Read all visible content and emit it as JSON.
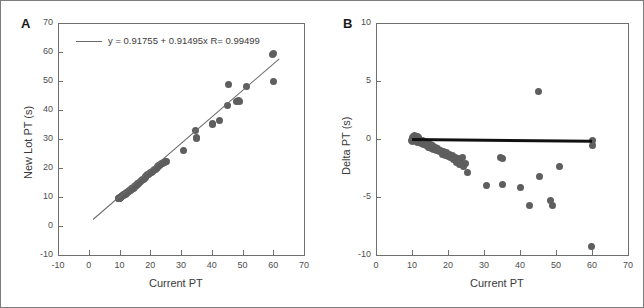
{
  "figure": {
    "background": "#ffffff",
    "border_color": "#7d7d7d",
    "marker_color": "#5e5e5e",
    "fitline_color": "#6b6b6b",
    "zeroline_color": "#111111"
  },
  "chart_data": [
    {
      "type": "scatter",
      "panel": "A",
      "panel_label": "A",
      "title": "",
      "xlabel": "Current PT",
      "ylabel": "New Lot PT (s)",
      "xlim": [
        -10,
        70
      ],
      "ylim": [
        -10,
        70
      ],
      "xticks": [
        -10,
        0,
        10,
        20,
        30,
        40,
        50,
        60,
        70
      ],
      "xticklabels": [
        "-10",
        "0",
        "10",
        "20",
        "30",
        "40",
        "50",
        "60",
        "70"
      ],
      "yticks": [
        -10,
        0,
        10,
        20,
        30,
        40,
        50,
        60,
        70
      ],
      "yticklabels": [
        "-10",
        "0",
        "10",
        "20",
        "30",
        "40",
        "50",
        "60",
        "70"
      ],
      "grid": false,
      "legend": "y = 0.91755 + 0.91495x   R= 0.99499",
      "annotation_equation": "y = 0.91755 + 0.91495x   R= 0.99499",
      "fit": {
        "intercept": 0.91755,
        "slope": 0.91495,
        "r": 0.99499,
        "x_start": 1.5,
        "x_end": 62.0
      },
      "x": [
        9.6,
        9.8,
        9.9,
        10.0,
        10.1,
        10.2,
        10.3,
        10.4,
        10.5,
        10.6,
        10.8,
        11.0,
        11.2,
        11.4,
        11.6,
        11.8,
        12.0,
        12.2,
        12.4,
        12.6,
        12.8,
        13.0,
        13.2,
        13.4,
        13.6,
        13.8,
        14.0,
        14.2,
        14.4,
        14.6,
        14.8,
        15.0,
        15.2,
        15.5,
        15.8,
        16.0,
        16.3,
        16.6,
        16.9,
        17.2,
        17.5,
        17.8,
        18.0,
        18.3,
        18.6,
        18.9,
        19.2,
        19.5,
        19.8,
        20.1,
        20.4,
        20.7,
        21.0,
        21.3,
        21.6,
        21.9,
        22.2,
        22.5,
        22.8,
        23.1,
        23.4,
        23.7,
        24.0,
        24.3,
        24.6,
        25.0,
        25.4,
        30.8,
        34.6,
        34.9,
        35.1,
        40.2,
        40.4,
        42.6,
        45.1,
        45.3,
        47.9,
        48.6,
        48.9,
        51.2,
        59.8,
        60.0,
        60.2
      ],
      "y": [
        9.5,
        9.4,
        9.6,
        9.7,
        9.5,
        9.8,
        10.0,
        9.9,
        10.1,
        10.2,
        10.3,
        10.5,
        10.4,
        10.8,
        10.9,
        11.0,
        11.2,
        11.3,
        11.5,
        11.6,
        11.8,
        12.0,
        12.1,
        12.3,
        12.4,
        12.6,
        12.8,
        12.9,
        13.1,
        13.2,
        13.4,
        13.6,
        13.8,
        14.0,
        14.3,
        14.5,
        14.8,
        15.1,
        15.4,
        15.6,
        15.9,
        16.2,
        16.4,
        16.7,
        17.0,
        17.3,
        17.6,
        17.8,
        18.1,
        18.4,
        18.6,
        18.9,
        19.1,
        19.4,
        19.6,
        19.9,
        20.2,
        20.5,
        20.8,
        21.0,
        21.2,
        21.4,
        21.6,
        21.8,
        22.0,
        22.1,
        22.2,
        26.0,
        32.9,
        30.3,
        30.6,
        35.4,
        35.1,
        36.3,
        41.5,
        48.7,
        43.0,
        43.2,
        42.9,
        48.0,
        59.2,
        59.4,
        49.8
      ]
    },
    {
      "type": "scatter",
      "panel": "B",
      "panel_label": "B",
      "title": "",
      "xlabel": "Current PT",
      "ylabel": "Delta PT (s)",
      "xlim": [
        0,
        70
      ],
      "ylim": [
        -10,
        10
      ],
      "xticks": [
        0,
        10,
        20,
        30,
        40,
        50,
        60,
        70
      ],
      "xticklabels": [
        "0",
        "10",
        "20",
        "30",
        "40",
        "50",
        "60",
        "70"
      ],
      "yticks": [
        -10,
        -5,
        0,
        5,
        10
      ],
      "yticklabels": [
        "-10",
        "-5",
        "0",
        "5",
        "10"
      ],
      "grid": false,
      "reference_line": {
        "y_start": 0.0,
        "y_end": -0.15,
        "x_start": 10.0,
        "x_end": 60.0
      },
      "x": [
        9.8,
        10.0,
        10.1,
        10.2,
        10.3,
        10.4,
        10.5,
        10.6,
        10.8,
        11.0,
        11.2,
        11.4,
        11.6,
        11.8,
        12.0,
        12.2,
        12.5,
        12.8,
        13.0,
        13.3,
        13.6,
        14.0,
        14.3,
        14.6,
        15.0,
        15.3,
        15.6,
        16.0,
        16.4,
        16.8,
        17.2,
        17.6,
        18.0,
        18.4,
        18.8,
        19.2,
        19.6,
        20.0,
        20.4,
        20.8,
        21.2,
        21.6,
        22.0,
        22.4,
        22.8,
        23.2,
        23.6,
        24.0,
        24.4,
        24.8,
        25.4,
        30.7,
        34.6,
        35.0,
        35.2,
        40.1,
        42.5,
        45.2,
        45.5,
        48.6,
        49.0,
        51.0,
        59.8,
        60.0,
        60.1
      ],
      "y": [
        -0.1,
        0.0,
        0.1,
        -0.2,
        0.2,
        0.0,
        -0.1,
        0.3,
        0.1,
        -0.1,
        0.0,
        0.2,
        -0.3,
        0.1,
        -0.2,
        0.0,
        -0.4,
        -0.1,
        -0.3,
        -0.5,
        -0.2,
        -0.6,
        -0.4,
        -0.7,
        -0.5,
        -0.8,
        -0.6,
        -0.9,
        -0.7,
        -1.0,
        -0.8,
        -1.1,
        -1.0,
        -1.3,
        -1.1,
        -1.4,
        -1.2,
        -1.5,
        -1.3,
        -1.6,
        -1.4,
        -1.8,
        -1.6,
        -2.0,
        -1.7,
        -2.2,
        -1.9,
        -1.6,
        -2.4,
        -2.1,
        -2.9,
        -4.0,
        -1.6,
        -3.9,
        -1.7,
        -4.2,
        -5.7,
        4.1,
        -3.2,
        -5.3,
        -5.7,
        -2.4,
        -9.3,
        -0.1,
        -0.6
      ]
    }
  ]
}
